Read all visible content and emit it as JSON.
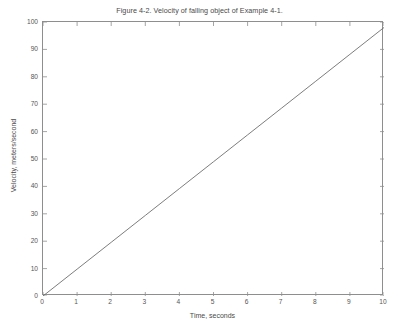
{
  "chart_data": {
    "type": "line",
    "title": "Figure 4-2. Velocity of falling object of Example 4-1.",
    "xlabel": "Time, seconds",
    "ylabel": "Velocity, meters/second",
    "xlim": [
      0,
      10
    ],
    "ylim": [
      0,
      100
    ],
    "xticks": [
      0,
      1,
      2,
      3,
      4,
      5,
      6,
      7,
      8,
      9,
      10
    ],
    "yticks": [
      0,
      10,
      20,
      30,
      40,
      50,
      60,
      70,
      80,
      90,
      100
    ],
    "xtick_labels": [
      "0",
      "1",
      "2",
      "3",
      "4",
      "5",
      "6",
      "7",
      "8",
      "9",
      "10"
    ],
    "ytick_labels": [
      "0",
      "10",
      "20",
      "30",
      "40",
      "50",
      "60",
      "70",
      "80",
      "90",
      "100"
    ],
    "grid": false,
    "legend": false,
    "box": true,
    "tick_direction": "in",
    "line_color": "#6e6e6e",
    "axis_color": "#8e8e8e",
    "text_color": "#4a4a4a",
    "background": "#ffffff",
    "series": [
      {
        "name": "Velocity",
        "x": [
          0,
          1,
          2,
          3,
          4,
          5,
          6,
          7,
          8,
          9,
          10
        ],
        "values": [
          0,
          9.8,
          19.6,
          29.4,
          39.2,
          49,
          58.8,
          68.6,
          78.4,
          88.2,
          98
        ]
      }
    ]
  }
}
